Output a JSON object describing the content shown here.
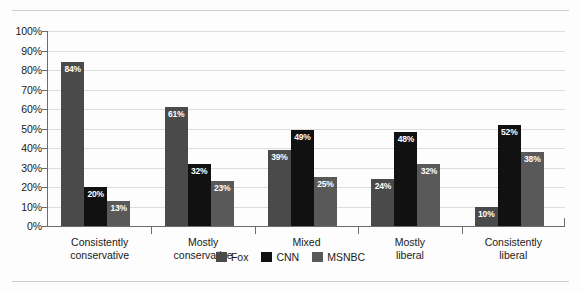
{
  "chart_data": {
    "type": "bar",
    "title": "",
    "subtitle": "",
    "xlabel": "",
    "ylabel": "",
    "ylim": [
      0,
      100
    ],
    "grid": true,
    "legend_position": "bottom-center",
    "categories": [
      "Consistently\nconservative",
      "Mostly\nconservative",
      "Mixed",
      "Mostly\nliberal",
      "Consistently\nliberal"
    ],
    "series": [
      {
        "name": "Fox",
        "color": "#4a4a4a",
        "values": [
          84,
          61,
          39,
          24,
          10
        ],
        "labels": [
          "84%",
          "61%",
          "39%",
          "24%",
          "10%"
        ]
      },
      {
        "name": "CNN",
        "color": "#111111",
        "values": [
          20,
          32,
          49,
          48,
          52
        ],
        "labels": [
          "20%",
          "32%",
          "49%",
          "48%",
          "52%"
        ]
      },
      {
        "name": "MSNBC",
        "color": "#595959",
        "values": [
          13,
          23,
          25,
          32,
          38
        ],
        "labels": [
          "13%",
          "23%",
          "25%",
          "32%",
          "38%"
        ]
      }
    ],
    "yticks": [
      0,
      10,
      20,
      30,
      40,
      50,
      60,
      70,
      80,
      90,
      100
    ],
    "ytick_labels": [
      "0%",
      "10%",
      "20%",
      "30%",
      "40%",
      "50%",
      "60%",
      "70%",
      "80%",
      "90%",
      "100%"
    ]
  },
  "legend": {
    "items": [
      {
        "label": "Fox",
        "color": "#4a4a4a"
      },
      {
        "label": "CNN",
        "color": "#111111"
      },
      {
        "label": "MSNBC",
        "color": "#595959"
      }
    ]
  }
}
